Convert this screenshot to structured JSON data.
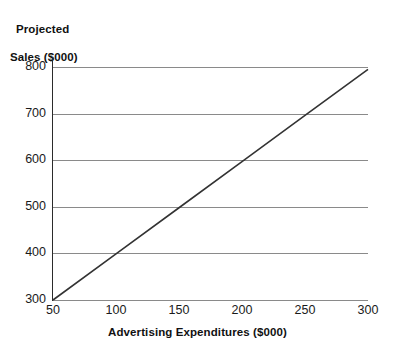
{
  "chart_data": {
    "type": "line",
    "title": "",
    "ylabel": "Projected Sales ($000)",
    "ylabel_line1": "Projected",
    "ylabel_line2": "Sales ($000)",
    "xlabel": "Advertising Expenditures ($000)",
    "xlim": [
      50,
      300
    ],
    "ylim": [
      300,
      800
    ],
    "xticks": [
      50,
      100,
      150,
      200,
      250,
      300
    ],
    "xtick_labels": [
      "50",
      "100",
      "150",
      "200",
      "250",
      "300"
    ],
    "yticks": [
      300,
      400,
      500,
      600,
      700,
      800
    ],
    "ytick_labels": [
      "300",
      "400",
      "500",
      "600",
      "700",
      "800"
    ],
    "grid": "horizontal",
    "legend": "none",
    "series": [
      {
        "name": "Projected Sales",
        "color": "#333333",
        "x": [
          50,
          100,
          150,
          200,
          250,
          300
        ],
        "values": [
          300,
          399,
          498,
          597,
          696,
          795
        ]
      }
    ],
    "line_color": "#333333",
    "grid_color": "#8a8a8a",
    "axis_color": "#2b2b2b",
    "background": "#ffffff"
  }
}
